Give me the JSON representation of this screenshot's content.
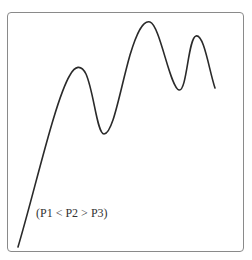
{
  "diagram": {
    "type": "waveform-sketch",
    "annotation": "(P1 < P2 > P3)",
    "peaks": [
      {
        "name": "P1",
        "x": 77,
        "y": 67
      },
      {
        "name": "P2",
        "x": 149,
        "y": 22
      },
      {
        "name": "P3",
        "x": 197,
        "y": 35
      }
    ],
    "colors": {
      "line": "#2a2a2a",
      "frame": "#8a8a8a",
      "text": "#333333",
      "background": "#ffffff"
    }
  }
}
